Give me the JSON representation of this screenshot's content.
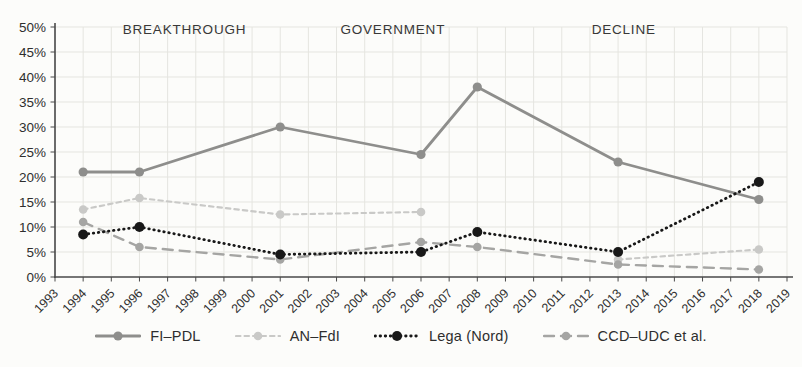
{
  "figure": {
    "kind": "scanned line chart of Italian centre-right party vote shares",
    "background_color": "#fcfcfa",
    "grid_color": "#e5e5e0",
    "axis_color": "#4a4a4a",
    "text_color": "#2e2e2e"
  },
  "chart_data": {
    "type": "line",
    "title": "",
    "xlabel": "",
    "ylabel": "",
    "x_range": [
      1993,
      2019
    ],
    "x_ticks": [
      "1993",
      "1994",
      "1995",
      "1996",
      "1997",
      "1998",
      "1999",
      "2000",
      "2001",
      "2002",
      "2003",
      "2004",
      "2005",
      "2006",
      "2007",
      "2008",
      "2009",
      "2010",
      "2011",
      "2012",
      "2013",
      "2014",
      "2015",
      "2016",
      "2017",
      "2018",
      "2019"
    ],
    "ylim": [
      0,
      50
    ],
    "y_tick_step": 5,
    "y_ticks": [
      "0%",
      "5%",
      "10%",
      "15%",
      "20%",
      "25%",
      "30%",
      "35%",
      "40%",
      "45%",
      "50%"
    ],
    "grid": true,
    "legend_position": "bottom",
    "annotations": [
      {
        "label": "BREAKTHROUGH",
        "x": 1997.6,
        "y": 48.6
      },
      {
        "label": "GOVERNMENT",
        "x": 2005.0,
        "y": 48.6
      },
      {
        "label": "DECLINE",
        "x": 2013.2,
        "y": 48.6
      }
    ],
    "series": [
      {
        "id": "an-fdi",
        "name": "AN–FdI",
        "color": "#c9c9c7",
        "dash": "4.5 4",
        "line_width": 2.1,
        "marker_r": 4.3,
        "segments": [
          [
            [
              1994,
              13.5
            ],
            [
              1996,
              15.8
            ],
            [
              2001,
              12.5
            ],
            [
              2006,
              13.0
            ]
          ],
          [
            [
              2013,
              3.5
            ],
            [
              2018,
              5.5
            ]
          ]
        ]
      },
      {
        "id": "ccd-udc-et-al",
        "name": "CCD–UDC et al.",
        "color": "#a5a5a3",
        "dash": "10 7",
        "line_width": 2.4,
        "marker_r": 4.3,
        "segments": [
          [
            [
              1994,
              11.0
            ],
            [
              1996,
              6.0
            ],
            [
              2001,
              3.5
            ],
            [
              2006,
              7.0
            ],
            [
              2008,
              6.0
            ],
            [
              2013,
              2.5
            ],
            [
              2018,
              1.5
            ]
          ]
        ]
      },
      {
        "id": "fi-pdl",
        "name": "FI–PDL",
        "color": "#8e8e8c",
        "dash": "",
        "line_width": 2.8,
        "marker_r": 4.6,
        "segments": [
          [
            [
              1994,
              21.0
            ],
            [
              1996,
              21.0
            ],
            [
              2001,
              30.0
            ],
            [
              2006,
              24.5
            ],
            [
              2008,
              38.0
            ],
            [
              2013,
              23.0
            ],
            [
              2018,
              15.5
            ]
          ]
        ]
      },
      {
        "id": "lega-nord",
        "name": "Lega (Nord)",
        "color": "#181818",
        "dash": "0.5 4.6",
        "line_width": 2.8,
        "marker_r": 5.0,
        "segments": [
          [
            [
              1994,
              8.5
            ],
            [
              1996,
              10.0
            ],
            [
              2001,
              4.5
            ],
            [
              2006,
              5.0
            ],
            [
              2008,
              9.0
            ],
            [
              2013,
              5.0
            ],
            [
              2018,
              19.0
            ]
          ]
        ]
      }
    ],
    "legend_order": [
      "fi-pdl",
      "an-fdi",
      "lega-nord",
      "ccd-udc-et-al"
    ]
  }
}
